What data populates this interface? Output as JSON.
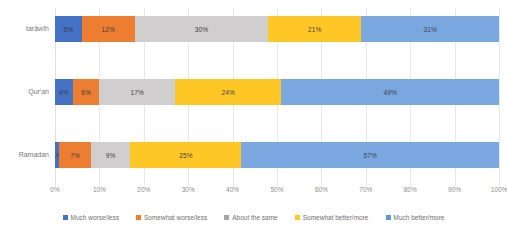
{
  "chart_data": {
    "type": "bar",
    "orientation": "horizontal",
    "stacked": true,
    "stack_mode": "percent",
    "title": "",
    "subtitle": "",
    "xlabel": "",
    "ylabel": "",
    "xlim": [
      0,
      100
    ],
    "grid": true,
    "legend_position": "bottom",
    "categories": [
      "tarāwīh",
      "Qur'an",
      "Ramadan"
    ],
    "x_ticks": [
      "0%",
      "10%",
      "20%",
      "30%",
      "40%",
      "50%",
      "60%",
      "70%",
      "80%",
      "90%",
      "100%"
    ],
    "x_tick_values": [
      0,
      10,
      20,
      30,
      40,
      50,
      60,
      70,
      80,
      90,
      100
    ],
    "series": [
      {
        "name": "Much worse/less",
        "color": "#4472C4",
        "values": [
          6,
          4,
          1
        ],
        "labels": [
          "6%",
          "4%",
          "1%"
        ]
      },
      {
        "name": "Somewhat worse/less",
        "color": "#ED7D31",
        "values": [
          12,
          6,
          7
        ],
        "labels": [
          "12%",
          "6%",
          "7%"
        ]
      },
      {
        "name": "About the same",
        "color": "#D0CECE",
        "values": [
          30,
          17,
          9
        ],
        "labels": [
          "30%",
          "17%",
          "9%"
        ]
      },
      {
        "name": "Somewhat better/more",
        "color": "#FFC726",
        "values": [
          21,
          24,
          25
        ],
        "labels": [
          "21%",
          "24%",
          "25%"
        ]
      },
      {
        "name": "Much better/more",
        "color": "#7BA7E0",
        "values": [
          31,
          49,
          57
        ],
        "labels": [
          "31%",
          "49%",
          "57%"
        ]
      }
    ],
    "rows": [
      {
        "category": "tarāwīh",
        "segments": [
          {
            "series": "Much worse/less",
            "value": 6,
            "label": "6%",
            "color": "#4472C4"
          },
          {
            "series": "Somewhat worse/less",
            "value": 12,
            "label": "12%",
            "color": "#ED7D31"
          },
          {
            "series": "About the same",
            "value": 30,
            "label": "30%",
            "color": "#D0CECE"
          },
          {
            "series": "Somewhat better/more",
            "value": 21,
            "label": "21%",
            "color": "#FFC726"
          },
          {
            "series": "Much better/more",
            "value": 31,
            "label": "31%",
            "color": "#7BA7E0"
          }
        ]
      },
      {
        "category": "Qur'an",
        "segments": [
          {
            "series": "Much worse/less",
            "value": 4,
            "label": "4%",
            "color": "#4472C4"
          },
          {
            "series": "Somewhat worse/less",
            "value": 6,
            "label": "6%",
            "color": "#ED7D31"
          },
          {
            "series": "About the same",
            "value": 17,
            "label": "17%",
            "color": "#D0CECE"
          },
          {
            "series": "Somewhat better/more",
            "value": 24,
            "label": "24%",
            "color": "#FFC726"
          },
          {
            "series": "Much better/more",
            "value": 49,
            "label": "49%",
            "color": "#7BA7E0"
          }
        ]
      },
      {
        "category": "Ramadan",
        "segments": [
          {
            "series": "Much worse/less",
            "value": 1,
            "label": "1%",
            "color": "#4472C4"
          },
          {
            "series": "Somewhat worse/less",
            "value": 7,
            "label": "7%",
            "color": "#ED7D31"
          },
          {
            "series": "About the same",
            "value": 9,
            "label": "9%",
            "color": "#D0CECE"
          },
          {
            "series": "Somewhat better/more",
            "value": 25,
            "label": "25%",
            "color": "#FFC726"
          },
          {
            "series": "Much better/more",
            "value": 58,
            "label": "57%",
            "color": "#7BA7E0"
          }
        ]
      }
    ]
  },
  "legend": {
    "items": [
      {
        "label": "Much worse/less",
        "color": "#4472C4"
      },
      {
        "label": "Somewhat worse/less",
        "color": "#ED7D31"
      },
      {
        "label": "About the same",
        "color": "#A5A5A5"
      },
      {
        "label": "Somewhat better/more",
        "color": "#FFC726"
      },
      {
        "label": "Much better/more",
        "color": "#5B9BD5"
      }
    ]
  }
}
